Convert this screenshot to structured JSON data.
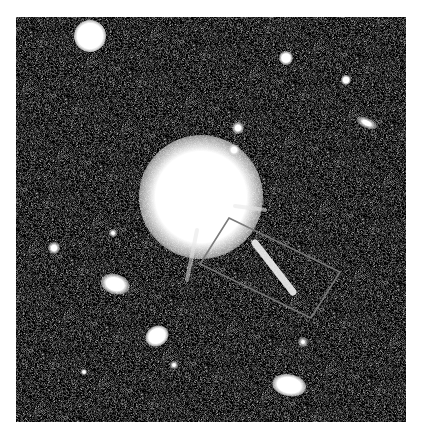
{
  "image": {
    "subject": "astronomical field with bright quasar and jet",
    "frame": {
      "x": 16,
      "y": 17,
      "width": 390,
      "height": 405
    },
    "background_color": "#2e2e2e",
    "objects": [
      {
        "name": "quasar-core",
        "x": 201,
        "y": 197,
        "r": 62,
        "core": 32,
        "rx": 1.0,
        "ry": 1.0,
        "rot": 0
      },
      {
        "name": "star-top-left",
        "x": 90,
        "y": 36,
        "r": 16,
        "core": 9,
        "rx": 1.0,
        "ry": 1.0,
        "rot": 0
      },
      {
        "name": "star-top",
        "x": 271,
        "y": 12,
        "r": 6,
        "core": 2,
        "rx": 1.0,
        "ry": 1.0,
        "rot": 0
      },
      {
        "name": "star-upper-right",
        "x": 286,
        "y": 58,
        "r": 7,
        "core": 3,
        "rx": 1.0,
        "ry": 1.0,
        "rot": 0
      },
      {
        "name": "star-right",
        "x": 346,
        "y": 80,
        "r": 5,
        "core": 2,
        "rx": 1.0,
        "ry": 1.0,
        "rot": 0
      },
      {
        "name": "galaxy-far-right",
        "x": 367,
        "y": 123,
        "r": 7,
        "core": 2,
        "rx": 1.6,
        "ry": 0.7,
        "rot": 25
      },
      {
        "name": "star-near-core-1",
        "x": 238,
        "y": 128,
        "r": 6,
        "core": 2,
        "rx": 1.0,
        "ry": 1.0,
        "rot": 0
      },
      {
        "name": "star-near-core-2",
        "x": 234,
        "y": 150,
        "r": 6,
        "core": 2,
        "rx": 1.0,
        "ry": 1.0,
        "rot": 0
      },
      {
        "name": "star-left",
        "x": 113,
        "y": 233,
        "r": 4,
        "core": 1,
        "rx": 1.0,
        "ry": 1.0,
        "rot": 0
      },
      {
        "name": "star-far-left",
        "x": 54,
        "y": 248,
        "r": 6,
        "core": 2,
        "rx": 1.0,
        "ry": 1.0,
        "rot": 0
      },
      {
        "name": "galaxy-left",
        "x": 115,
        "y": 284,
        "r": 11,
        "core": 5,
        "rx": 1.3,
        "ry": 0.9,
        "rot": 15
      },
      {
        "name": "galaxy-lower-left",
        "x": 157,
        "y": 336,
        "r": 10,
        "core": 5,
        "rx": 1.2,
        "ry": 1.0,
        "rot": -30
      },
      {
        "name": "star-lower",
        "x": 174,
        "y": 365,
        "r": 4,
        "core": 1,
        "rx": 1.0,
        "ry": 1.0,
        "rot": 0
      },
      {
        "name": "galaxy-bottom-right",
        "x": 289,
        "y": 385,
        "r": 12,
        "core": 6,
        "rx": 1.4,
        "ry": 0.9,
        "rot": 10
      },
      {
        "name": "star-lower-right",
        "x": 303,
        "y": 342,
        "r": 5,
        "core": 1,
        "rx": 1.0,
        "ry": 1.0,
        "rot": 0
      },
      {
        "name": "star-bottom-left",
        "x": 84,
        "y": 372,
        "r": 3,
        "core": 1,
        "rx": 1.0,
        "ry": 1.0,
        "rot": 0
      }
    ],
    "jet": {
      "x1": 255,
      "y1": 243,
      "x2": 293,
      "y2": 292,
      "width": 7,
      "color": "#f2f2f2"
    },
    "highlight_box": {
      "points": [
        [
          229,
          218
        ],
        [
          340,
          272
        ],
        [
          311,
          318
        ],
        [
          200,
          264
        ]
      ],
      "stroke": "#7a7a7a",
      "stroke_width": 1.6
    },
    "diffraction_spikes": [
      {
        "x1": 197,
        "y1": 230,
        "x2": 187,
        "y2": 280
      },
      {
        "x1": 235,
        "y1": 206,
        "x2": 265,
        "y2": 210
      }
    ]
  }
}
